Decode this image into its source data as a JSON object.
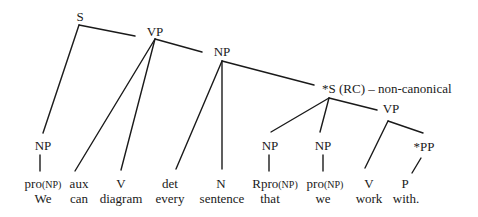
{
  "diagram": {
    "type": "syntax-tree",
    "colors": {
      "line": "#1a1a1a",
      "text": "#1a1a1a",
      "background": "#ffffff"
    },
    "nodes": {
      "s": {
        "label": "S"
      },
      "vp_main": {
        "label": "VP"
      },
      "np_obj": {
        "label": "NP"
      },
      "s_rc": {
        "label": "*S (RC) – non-canonical"
      },
      "vp_rc": {
        "label": "VP"
      },
      "np_subj": {
        "label": "NP"
      },
      "np_rel": {
        "label": "NP"
      },
      "np_rc_subj": {
        "label": "NP"
      },
      "pp": {
        "label": "*PP"
      }
    },
    "leaves": [
      {
        "pos": "pro",
        "pos_sub": "(NP)",
        "word": "We"
      },
      {
        "pos": "aux",
        "pos_sub": "",
        "word": "can"
      },
      {
        "pos": "V",
        "pos_sub": "",
        "word": "diagram"
      },
      {
        "pos": "det",
        "pos_sub": "",
        "word": "every"
      },
      {
        "pos": "N",
        "pos_sub": "",
        "word": "sentence"
      },
      {
        "pos": "Rpro",
        "pos_sub": "(NP)",
        "word": "that"
      },
      {
        "pos": "pro",
        "pos_sub": "(NP)",
        "word": "we"
      },
      {
        "pos": "V",
        "pos_sub": "",
        "word": "work"
      },
      {
        "pos": "P",
        "pos_sub": "",
        "word": "with."
      }
    ]
  }
}
